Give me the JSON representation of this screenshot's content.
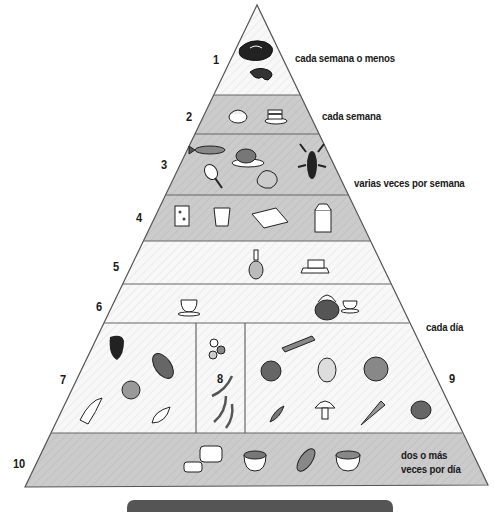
{
  "colors": {
    "shaded_band": "#c9c9c9",
    "light_band": "#f7f7f7",
    "outline": "#555555",
    "text": "#1a1a1a",
    "bar": "#555555"
  },
  "levels": [
    {
      "number": "1",
      "frequency": "cada semana o menos",
      "foods": [
        "steak",
        "ham"
      ]
    },
    {
      "number": "2",
      "frequency": "cada semana",
      "foods": [
        "sugar-bowl",
        "cake"
      ]
    },
    {
      "number": "3",
      "frequency": "varias veces por semana",
      "foods": [
        "fish",
        "roast-chicken",
        "chicken-leg",
        "shrimp",
        "lobster"
      ]
    },
    {
      "number": "4",
      "frequency": "",
      "foods": [
        "cheese",
        "yogurt",
        "eggs",
        "milk-carton"
      ]
    },
    {
      "number": "5",
      "frequency": "",
      "foods": [
        "oil-cruet",
        "butter"
      ]
    },
    {
      "number": "6",
      "frequency": "",
      "foods": [
        "coffee-cup",
        "teapot",
        "tea-cup"
      ]
    },
    {
      "number": "7",
      "frequency": "cada día",
      "foods": [
        "strawberry",
        "grapes",
        "lemon",
        "banana",
        "melon-slice"
      ]
    },
    {
      "number": "8",
      "frequency": "",
      "foods": [
        "beans",
        "green-beans"
      ]
    },
    {
      "number": "9",
      "frequency": "",
      "foods": [
        "cucumber",
        "tomato",
        "potato",
        "lettuce",
        "peas",
        "mushroom",
        "carrot",
        "onion"
      ]
    },
    {
      "number": "10",
      "frequency": "dos o más veces por día",
      "frequency_lines": [
        "dos o más",
        "veces por día"
      ],
      "foods": [
        "bread",
        "cereal-bowl",
        "corn",
        "rice-bowl"
      ]
    }
  ]
}
